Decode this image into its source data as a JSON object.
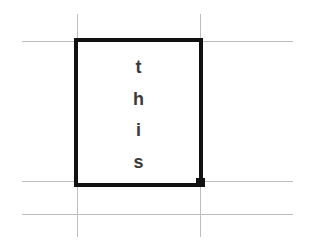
{
  "spreadsheet": {
    "selected_cell": {
      "text": "this",
      "lines": [
        "t",
        "h",
        "i",
        "s"
      ],
      "orientation": "vertical-stacked"
    },
    "colors": {
      "gridline": "#bdbdbd",
      "selection_border": "#111111",
      "text": "#3a3a3a",
      "background": "#ffffff"
    }
  }
}
